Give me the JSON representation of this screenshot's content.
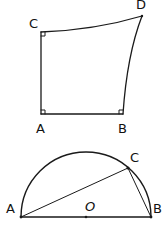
{
  "figure1": {
    "description": "Quadrilateral with right angles at A, B, C; curved sides CD and BD",
    "labels": {
      "C": "C",
      "D": "D",
      "A": "A",
      "B": "B"
    },
    "points": {
      "C": [
        41,
        32
      ],
      "D": [
        142,
        16
      ],
      "A": [
        41,
        114
      ],
      "B": [
        123,
        114
      ]
    },
    "right_angle_markers": [
      "C",
      "A",
      "B"
    ]
  },
  "figure2": {
    "description": "Semicircle with diameter AB, center O, point C on arc, chords AC and CB",
    "labels": {
      "A": "A",
      "B": "B",
      "C": "C",
      "O": "O"
    },
    "points": {
      "A": [
        21,
        217
      ],
      "B": [
        151,
        217
      ],
      "C": [
        128,
        168
      ],
      "O": [
        86,
        217
      ]
    },
    "radius": 65
  },
  "colors": {
    "stroke": "#1a1a1a",
    "background": "#ffffff"
  }
}
